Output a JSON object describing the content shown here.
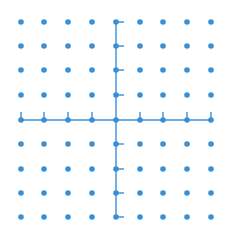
{
  "diagram": {
    "type": "lattice-grid-with-axes",
    "color": "#3a8fd4",
    "background": "#ffffff",
    "columns_x": [
      21,
      44,
      68,
      92,
      116,
      140,
      163,
      187,
      211
    ],
    "rows_y": [
      22,
      46,
      70,
      95,
      120,
      144,
      169,
      193,
      217
    ],
    "axis_column_index": 4,
    "axis_row_index": 4,
    "dot_radius": 2.8,
    "tick_length": 8,
    "horizontal_axis_ticks": "up",
    "vertical_axis_ticks": "right"
  }
}
